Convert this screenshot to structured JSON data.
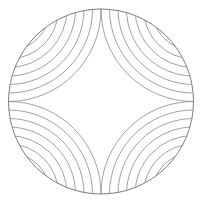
{
  "diagram": {
    "circle": {
      "cx": 101,
      "cy": 101.5,
      "r": 92.5
    },
    "arcs_per_quadrant": 10,
    "arc_spacing": 8.5,
    "colors": {
      "stroke": "#8a8a8a",
      "outline": "#6e6e6e",
      "background": "#ffffff"
    },
    "quadrants": [
      {
        "name": "top-left",
        "cx": 8.5,
        "cy": 9
      },
      {
        "name": "top-right",
        "cx": 193.5,
        "cy": 9
      },
      {
        "name": "bottom-left",
        "cx": 8.5,
        "cy": 194
      },
      {
        "name": "bottom-right",
        "cx": 193.5,
        "cy": 194
      }
    ]
  }
}
